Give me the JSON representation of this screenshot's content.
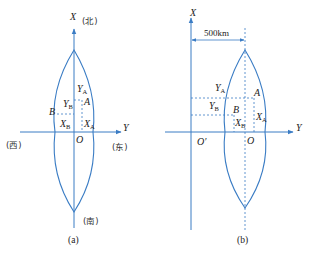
{
  "figure_a": {
    "caption": "(a)",
    "axis_x_label": "X",
    "axis_y_label": "Y",
    "north_label": "(北)",
    "south_label": "(南)",
    "west_label": "(西)",
    "east_label": "(东)",
    "origin_label": "O",
    "point_a": "A",
    "point_b": "B",
    "ya_main": "Y",
    "ya_sub": "A",
    "yb_main": "Y",
    "yb_sub": "B",
    "xa_main": "X",
    "xa_sub": "A",
    "xb_main": "X",
    "xb_sub": "B"
  },
  "figure_b": {
    "caption": "(b)",
    "axis_x_label": "X",
    "axis_y_label": "Y",
    "offset_label": "500km",
    "origin_label": "O",
    "false_origin_label": "O′",
    "point_a": "A",
    "point_b": "B",
    "ya_main": "Y",
    "ya_sub": "A",
    "yb_main": "Y",
    "yb_sub": "B",
    "xa_main": "X",
    "xa_sub": "A",
    "xb_main": "X",
    "xb_sub": "B"
  },
  "colors": {
    "line": "#3a7cc4",
    "text": "#222222"
  }
}
